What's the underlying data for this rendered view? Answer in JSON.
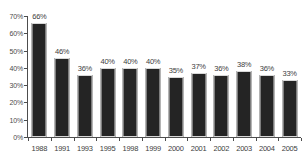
{
  "chart_data": {
    "type": "bar",
    "title": "",
    "subtitle": "",
    "xlabel": "",
    "ylabel": "",
    "categories": [
      "1988",
      "1991",
      "1993",
      "1995",
      "1998",
      "1999",
      "2000",
      "2001",
      "2002",
      "2003",
      "2004",
      "2005"
    ],
    "values": [
      66,
      46,
      36,
      40,
      40,
      40,
      35,
      37,
      36,
      38,
      36,
      33
    ],
    "data_labels": [
      "66%",
      "46%",
      "36%",
      "40%",
      "40%",
      "40%",
      "35%",
      "37%",
      "36%",
      "38%",
      "36%",
      "33%"
    ],
    "ylim": [
      0,
      70
    ],
    "ytick_values": [
      0,
      10,
      20,
      30,
      40,
      50,
      60,
      70
    ],
    "ytick_labels": [
      "0%",
      "10%",
      "20%",
      "30%",
      "40%",
      "50%",
      "60%",
      "70%"
    ],
    "grid": false,
    "legend": null,
    "legend_position": "none",
    "bar_color": "#242424",
    "bar_border_color": "#d8d8d8",
    "axis_color": "#4d4d4d",
    "text_color": "#404040",
    "background_color": "#ffffff"
  }
}
